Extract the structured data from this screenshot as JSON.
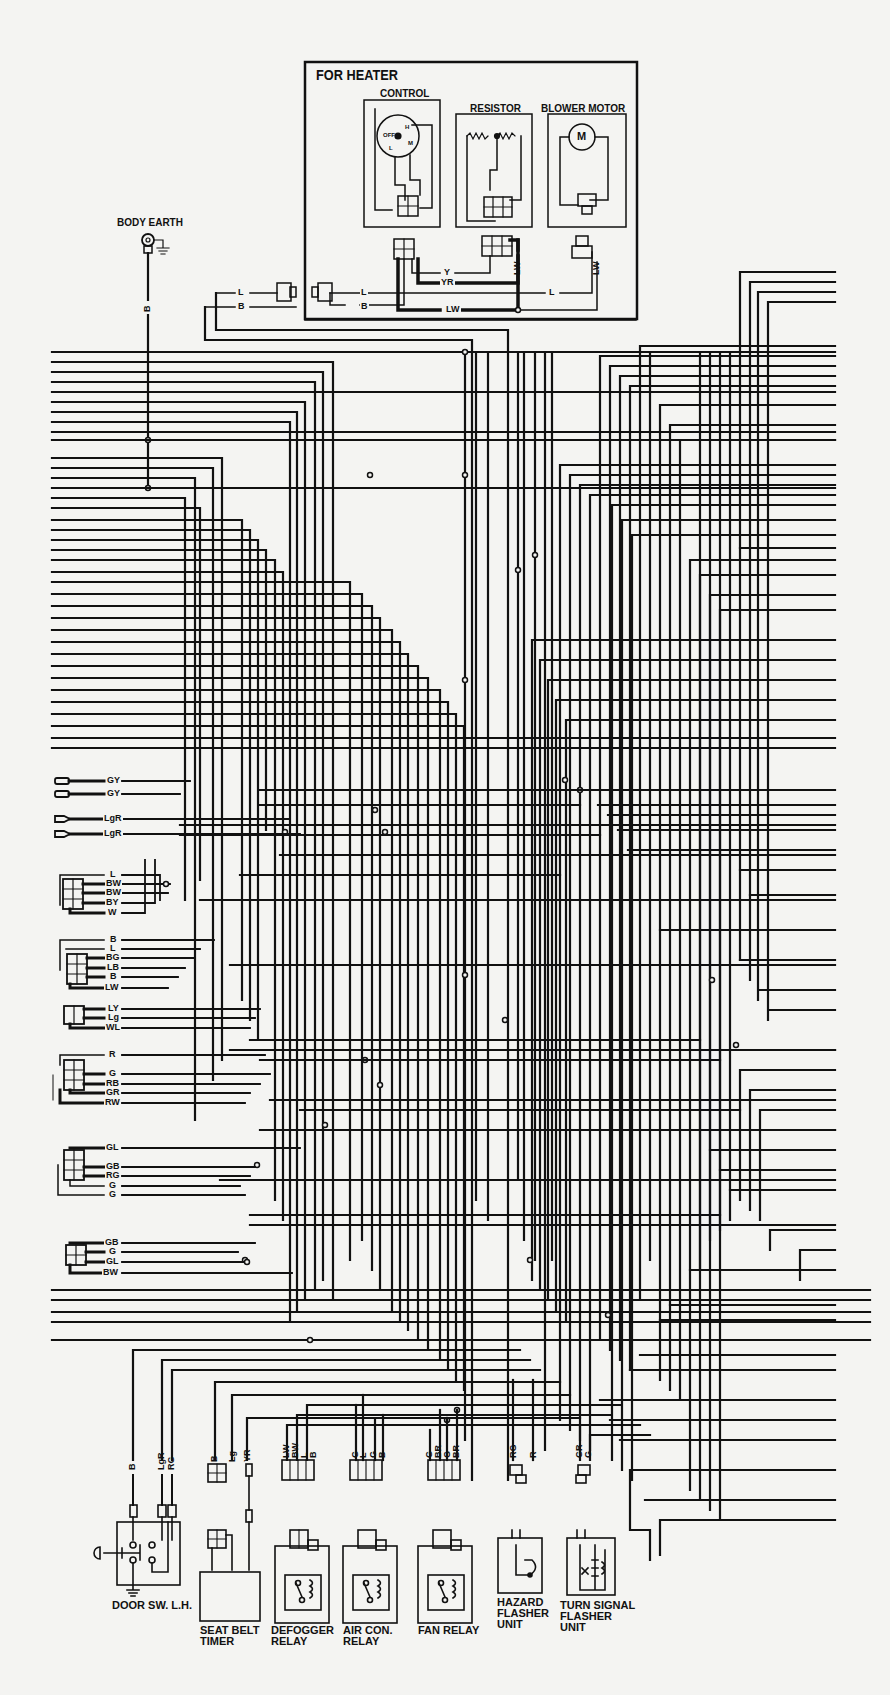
{
  "heater": {
    "title": "FOR HEATER",
    "control_label": "CONTROL",
    "resistor_label": "RESISTOR",
    "blower_label": "BLOWER MOTOR",
    "motor_symbol": "M",
    "control_positions": [
      "OFF",
      "L",
      "M",
      "H"
    ],
    "wires": {
      "y": "Y",
      "yr": "YR",
      "l_left": "L",
      "b_left": "B",
      "l_mid": "L",
      "b_mid": "B",
      "lw_bottom": "LW",
      "l_right": "L",
      "lw_resistor": "LW",
      "lw_blower": "LW"
    }
  },
  "body_earth": {
    "label": "BODY EARTH",
    "wire": "B"
  },
  "left_connectors": [
    {
      "id": "bullet-gy",
      "wires": [
        "GY",
        "GY"
      ]
    },
    {
      "id": "bullet-lgr",
      "wires": [
        "LgR",
        "LgR"
      ]
    },
    {
      "id": "conn-a",
      "wires": [
        "L",
        "BW",
        "BW",
        "BY",
        "W"
      ]
    },
    {
      "id": "conn-b",
      "wires": [
        "B",
        "L",
        "BG",
        "LB",
        "B",
        "LW"
      ]
    },
    {
      "id": "conn-c",
      "wires": [
        "LY",
        "Lg",
        "WL"
      ]
    },
    {
      "id": "conn-d",
      "wires": [
        "R",
        "G",
        "RB",
        "GR",
        "RW"
      ]
    },
    {
      "id": "conn-e",
      "wires": [
        "GL",
        "GB",
        "RG",
        "G",
        "G"
      ]
    },
    {
      "id": "conn-f",
      "wires": [
        "GB",
        "G",
        "GL",
        "BW"
      ]
    }
  ],
  "bottom_components": [
    {
      "id": "door-sw",
      "label": "DOOR SW. L.H.",
      "wires": [
        "B",
        "LgR",
        "RG"
      ]
    },
    {
      "id": "seat-belt-timer",
      "label": "SEAT BELT TIMER",
      "wires": [
        "B",
        "Lg",
        "YR"
      ]
    },
    {
      "id": "defogger-relay",
      "label": "DEFOGGER RELAY",
      "wires": [
        "LW",
        "BW",
        "L",
        "B"
      ]
    },
    {
      "id": "air-con-relay",
      "label": "AIR CON. RELAY",
      "wires": [
        "G",
        "L",
        "G",
        "B"
      ]
    },
    {
      "id": "fan-relay",
      "label": "FAN RELAY",
      "wires": [
        "G",
        "BR",
        "G",
        "BR"
      ]
    },
    {
      "id": "hazard-flasher",
      "label": "HAZARD FLASHER UNIT",
      "wires": [
        "RG",
        "R"
      ]
    },
    {
      "id": "turn-signal-flasher",
      "label": "TURN SIGNAL FLASHER UNIT",
      "wires": [
        "GR",
        "G"
      ]
    }
  ],
  "colors": {
    "ink": "#111111",
    "paper": "#f4f4f2"
  }
}
